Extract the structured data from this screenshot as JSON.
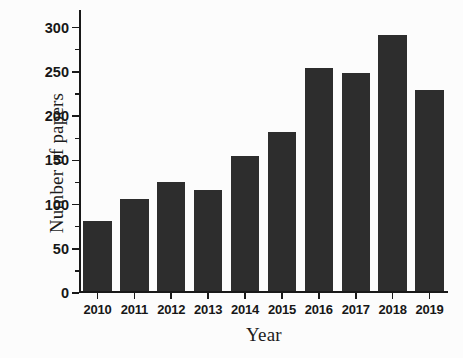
{
  "chart_data": {
    "type": "bar",
    "title": "",
    "xlabel": "Year",
    "ylabel": "Number of papers",
    "categories": [
      "2010",
      "2011",
      "2012",
      "2013",
      "2014",
      "2015",
      "2016",
      "2017",
      "2018",
      "2019"
    ],
    "values": [
      80,
      104,
      124,
      115,
      153,
      180,
      253,
      247,
      290,
      228
    ],
    "ylim": [
      0,
      320
    ],
    "xlim_note": "categorical",
    "y_ticks_major": [
      0,
      50,
      100,
      150,
      200,
      250,
      300
    ],
    "y_tick_labels": [
      "0",
      "50",
      "100",
      "150",
      "200",
      "250",
      "300"
    ],
    "y_ticks_minor": [
      25,
      75,
      125,
      175,
      225,
      275
    ],
    "grid": false,
    "legend": false,
    "bar_color": "#2d2d2d",
    "axis_color": "#191919",
    "background_color": "#fcfcfc"
  }
}
